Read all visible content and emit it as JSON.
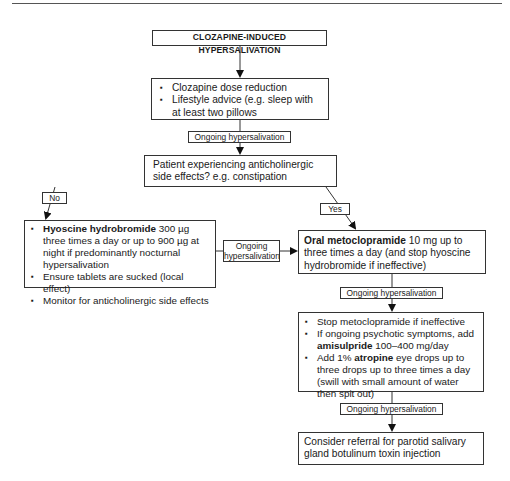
{
  "diagram": {
    "title": "CLOZAPINE-INDUCED HYPERSALIVATION",
    "step1": {
      "items": [
        "Clozapine dose reduction",
        "Lifestyle advice (e.g. sleep with at least two pillows"
      ]
    },
    "connector_label": "Ongoing hypersalivation",
    "decision": {
      "text": "Patient experiencing anticholinergic side effects? e.g. constipation",
      "no_label": "No",
      "yes_label": "Yes"
    },
    "no_branch": {
      "item1_bold": "Hyoscine hydrobromide",
      "item1_rest": " 300 µg three times a day or up to 900 µg at night if predominantly nocturnal hypersalivation",
      "item2": "Ensure tablets are sucked (local effect)",
      "item3": "Monitor for anticholinergic side effects"
    },
    "side_connector": {
      "line1": "Ongoing",
      "line2": "hypersalivation"
    },
    "yes_branch": {
      "bold": "Oral metoclopramide",
      "rest": " 10 mg up to three times a day (and stop hyoscine hydrobromide if ineffective)"
    },
    "step3": {
      "item1": "Stop metoclopramide if ineffective",
      "item2_pre": "If ongoing psychotic symptoms, add ",
      "item2_bold": "amisulpride",
      "item2_post": " 100–400 mg/day",
      "item3_pre": "Add 1% ",
      "item3_bold": "atropine",
      "item3_post": " eye drops up to three drops up to three times a day (swill with small amount of water then  spit out)"
    },
    "step4": {
      "text": "Consider referral for parotid salivary gland botulinum toxin injection"
    }
  }
}
